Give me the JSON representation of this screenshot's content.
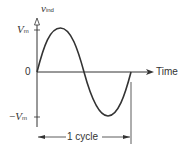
{
  "diagram": {
    "y_axis_label": {
      "main": "v",
      "sub": "ind"
    },
    "x_axis_label": "Time",
    "ticks": {
      "vm": {
        "main": "V",
        "sub": "m"
      },
      "zero": "0",
      "neg_vm": {
        "prefix": "−",
        "main": "V",
        "sub": "m"
      }
    },
    "period_label": "1 cycle",
    "curve": {
      "type": "sine",
      "cycles": 1,
      "color": "#333333"
    }
  }
}
